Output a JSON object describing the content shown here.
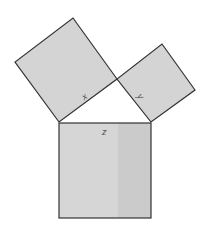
{
  "diagram": {
    "colors": {
      "fill": "#d4d4d4",
      "fill_dark": "#cbcbcb",
      "stroke": "#333333",
      "background": "#ffffff",
      "label": "#555555"
    },
    "squares": [
      {
        "id": "x",
        "label": "x",
        "points": "73,18 117,79 59,122 15,62"
      },
      {
        "id": "y",
        "label": "y",
        "points": "162,44 195,90 151,122 117,79"
      },
      {
        "id": "z",
        "label": "z",
        "points": "59,123 151,123 151,218 59,218"
      }
    ],
    "triangle": {
      "points": "59,122 117,79 151,122"
    }
  }
}
